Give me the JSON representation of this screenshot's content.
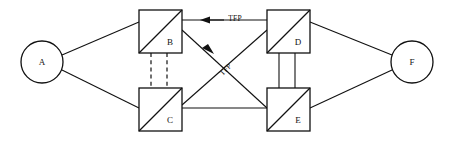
{
  "diagram": {
    "title": "",
    "background_color": "#ffffff",
    "line_color": "#111111",
    "nodes": [
      {
        "id": "A",
        "label": "A",
        "shape": "circle",
        "cx": 42,
        "cy": 62,
        "r": 21
      },
      {
        "id": "B",
        "label": "B",
        "shape": "square-diagonal",
        "x": 139,
        "y": 10,
        "size": 43
      },
      {
        "id": "C",
        "label": "C",
        "shape": "square-diagonal",
        "x": 139,
        "y": 88,
        "size": 43
      },
      {
        "id": "D",
        "label": "D",
        "shape": "square-diagonal",
        "x": 267,
        "y": 10,
        "size": 43
      },
      {
        "id": "E",
        "label": "E",
        "shape": "square-diagonal",
        "x": 267,
        "y": 88,
        "size": 43
      },
      {
        "id": "F",
        "label": "F",
        "shape": "circle",
        "cx": 412,
        "cy": 62,
        "r": 21
      }
    ],
    "edges": [
      {
        "id": "a-b",
        "from": "A",
        "to": "B",
        "style": "solid",
        "multiplicity": 1,
        "arrow": "none",
        "label": ""
      },
      {
        "id": "a-c",
        "from": "A",
        "to": "C",
        "style": "solid",
        "multiplicity": 1,
        "arrow": "none",
        "label": ""
      },
      {
        "id": "b-d",
        "from": "D",
        "to": "B",
        "style": "solid",
        "multiplicity": 1,
        "arrow": "to-b",
        "label": "TFP"
      },
      {
        "id": "b-c",
        "from": "B",
        "to": "C",
        "style": "dashed",
        "multiplicity": 2,
        "arrow": "none",
        "label": ""
      },
      {
        "id": "d-e",
        "from": "D",
        "to": "E",
        "style": "solid",
        "multiplicity": 2,
        "arrow": "none",
        "label": ""
      },
      {
        "id": "e-b",
        "from": "E",
        "to": "B",
        "style": "solid",
        "multiplicity": 1,
        "arrow": "to-b",
        "label": "TFP"
      },
      {
        "id": "c-d",
        "from": "C",
        "to": "D",
        "style": "solid",
        "multiplicity": 1,
        "arrow": "none",
        "label": ""
      },
      {
        "id": "c-e",
        "from": "C",
        "to": "E",
        "style": "solid",
        "multiplicity": 1,
        "arrow": "none",
        "label": ""
      },
      {
        "id": "d-f",
        "from": "D",
        "to": "F",
        "style": "solid",
        "multiplicity": 1,
        "arrow": "none",
        "label": ""
      },
      {
        "id": "e-f",
        "from": "E",
        "to": "F",
        "style": "solid",
        "multiplicity": 1,
        "arrow": "none",
        "label": ""
      }
    ],
    "labels": {
      "node_a": "A",
      "node_b": "B",
      "node_c": "C",
      "node_d": "D",
      "node_e": "E",
      "node_f": "F",
      "flow_top": "TFP",
      "flow_diagonal": "TFP"
    }
  }
}
